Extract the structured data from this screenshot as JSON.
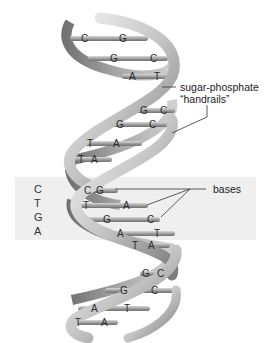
{
  "figure": {
    "labels": {
      "handrails_line1": "sugar-phosphate",
      "handrails_line2": "“handrails”",
      "bases": "bases"
    },
    "highlight_strand": [
      "C",
      "T",
      "G",
      "A"
    ],
    "base_pairs": [
      {
        "left": "C",
        "right": "G"
      },
      {
        "left": "G",
        "right": "C"
      },
      {
        "left": "A",
        "right": "T"
      },
      {
        "left": "G",
        "right": "C"
      },
      {
        "left": "G",
        "right": "C"
      },
      {
        "left": "T",
        "right": "A"
      },
      {
        "left": "T",
        "right": "A"
      },
      {
        "left": "C",
        "right": "G"
      },
      {
        "left": "T",
        "right": "A"
      },
      {
        "left": "G",
        "right": "C"
      },
      {
        "left": "A",
        "right": "T"
      },
      {
        "left": "T",
        "right": "A"
      },
      {
        "left": "G",
        "right": "C"
      },
      {
        "left": "G",
        "right": "C"
      },
      {
        "left": "A",
        "right": "T"
      },
      {
        "left": "T",
        "right": "A"
      }
    ],
    "colors": {
      "band": "#efefef",
      "ribbon_light": "#e6e6e6",
      "ribbon_dark": "#8a8a8a",
      "rung": "#9a9a9a"
    }
  }
}
